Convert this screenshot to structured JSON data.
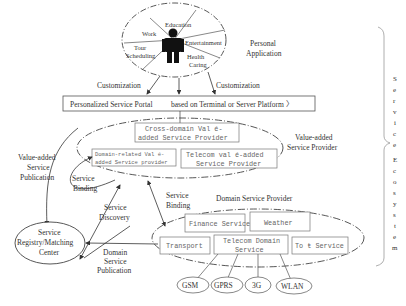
{
  "personal_application": {
    "label_line1": "Personal",
    "label_line2": "Application",
    "sectors": {
      "work": "Work",
      "education": "Education",
      "entertainment": "Entertainment",
      "tour_line1": "Tour",
      "tour_line2": "Scheduling",
      "health_line1": "Health",
      "health_line2": "Caring"
    }
  },
  "customization_left": "Customization",
  "customization_right": "Customization",
  "portal": {
    "label": "Personalized Service Portal",
    "suffix": "based on Terminal or Server Platform 〉"
  },
  "value_added": {
    "label_line1": "Value-added",
    "label_line2": "Service Provider",
    "cross_domain_line1": "Cross-domain Val é-",
    "cross_domain_line2": "added Service Provider",
    "domain_related_line1": "Domain-related Val é-",
    "domain_related_line2": "added Service provider",
    "telecom_line1": "Telecom val é-added",
    "telecom_line2": "Service Provider"
  },
  "left_labels": {
    "publication_line1": "Value-added",
    "publication_line2": "Service",
    "publication_line3": "Publication",
    "binding_line1": "Service",
    "binding_line2": "Binding",
    "discovery_line1": "Service",
    "discovery_line2": "Discovery",
    "binding2_line1": "Service",
    "binding2_line2": "Binding"
  },
  "registry": {
    "line1": "Service",
    "line2": "Registry/Matching",
    "line3": "Center"
  },
  "domain_publication": {
    "line1": "Domain",
    "line2": "Service",
    "line3": "Publication"
  },
  "domain_provider": {
    "label": "Domain Service Provider",
    "finance": "Finance Service",
    "weather": "Weather",
    "transport": "Transport",
    "telecom_line1": "Telecom Domain",
    "telecom_line2": "Service",
    "tour": "To ŧ Service"
  },
  "networks": [
    "GSM",
    "GPRS",
    "3G",
    "WLAN"
  ],
  "ecosystem_letters": [
    "S",
    "e",
    "r",
    "v",
    "i",
    "c",
    "e",
    "E",
    "c",
    "o",
    "s",
    "y",
    "s",
    "t",
    "e",
    "m"
  ]
}
